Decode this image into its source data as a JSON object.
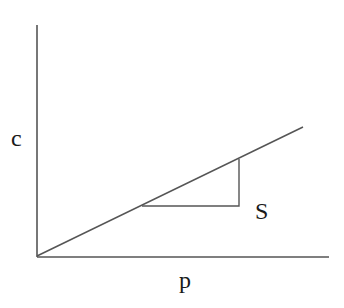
{
  "diagram": {
    "type": "line-slope-diagram",
    "labels": {
      "y_axis": "c",
      "x_axis": "p",
      "slope": "S"
    },
    "colors": {
      "line": "#555555",
      "text": "#1a1a1a",
      "background": "#ffffff"
    },
    "geometry": {
      "y_axis": {
        "x": 37,
        "y1": 25,
        "y2": 257
      },
      "x_axis": {
        "y": 257,
        "x1": 37,
        "x2": 329
      },
      "line": {
        "x1": 37,
        "y1": 256,
        "x2": 303,
        "y2": 127
      },
      "slope_triangle": {
        "x1": 142,
        "x2": 239,
        "y_base": 206,
        "y_top": 159
      }
    }
  }
}
